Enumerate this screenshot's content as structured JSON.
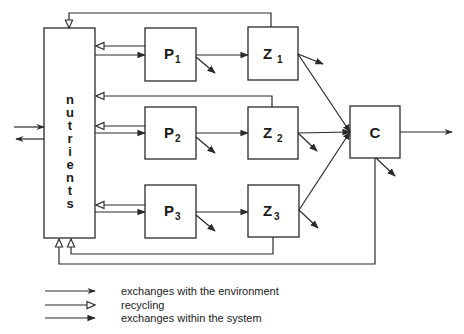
{
  "diagram": {
    "nutrients_label": [
      "n",
      "u",
      "t",
      "r",
      "i",
      "e",
      "n",
      "t",
      "s"
    ],
    "nodes": {
      "P1": {
        "main": "P",
        "sub": "1"
      },
      "P2": {
        "main": "P",
        "sub": "2"
      },
      "P3": {
        "main": "P",
        "sub": "3"
      },
      "Z1": {
        "main": "Z",
        "sub": "1"
      },
      "Z2": {
        "main": "Z",
        "sub": "2"
      },
      "Z3": {
        "main": "Z",
        "sub": "3"
      },
      "C": {
        "main": "C",
        "sub": ""
      }
    },
    "colors": {
      "stroke": "#2a2a2a",
      "background": "#ffffff"
    }
  },
  "legend": {
    "items": [
      {
        "arrow": "thin-arrow",
        "label": "exchanges with the environment"
      },
      {
        "arrow": "hollow-arrow",
        "label": "recycling"
      },
      {
        "arrow": "solid-arrow",
        "label": "exchanges within the system"
      }
    ]
  }
}
